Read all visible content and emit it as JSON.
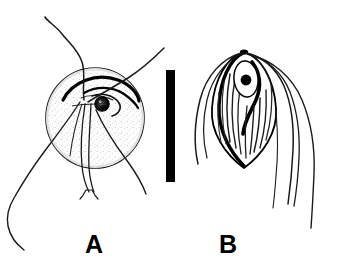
{
  "figure": {
    "type": "scientific-line-drawing",
    "background_color": "#ffffff",
    "ink_color": "#000000",
    "stipple_color": "#d9d9d9",
    "width": 338,
    "height": 266,
    "panels": [
      {
        "id": "A",
        "label": "A",
        "label_x": 85,
        "label_y": 232,
        "subject": "rounded flagellate cell with apical collar and long wavy flagella",
        "body_shape": "ovoid",
        "body_center_x": 95,
        "body_center_y": 118,
        "body_radius_x": 49,
        "body_radius_y": 50,
        "nucleus": {
          "name": "nucleus",
          "center_x": 102,
          "center_y": 104,
          "radius": 7,
          "fill": "#000000",
          "has_internal_texture": true
        },
        "collar": {
          "name": "apical-collar",
          "description": "dark curved collar arc across the upper body"
        },
        "flagella_count": 5,
        "stippled": true
      },
      {
        "id": "B",
        "label": "B",
        "label_x": 219,
        "label_y": 232,
        "subject": "lanceolate striated cell with apical nucleus and long trailing flagella",
        "body_shape": "teardrop",
        "body_apex_x": 244,
        "body_apex_y": 52,
        "body_tip_x": 244,
        "body_tip_y": 168,
        "nucleus": {
          "name": "nucleus",
          "center_x": 246,
          "center_y": 79,
          "radius": 5,
          "fill": "#000000",
          "has_halo": true,
          "halo_rx": 12,
          "halo_ry": 18
        },
        "striations": true,
        "flagella_count": 6,
        "stippled": false
      }
    ],
    "scale_bar": {
      "name": "scale-bar",
      "orientation": "vertical",
      "x": 166,
      "y": 70,
      "width": 9,
      "height": 112,
      "color": "#000000",
      "caption": ""
    }
  }
}
